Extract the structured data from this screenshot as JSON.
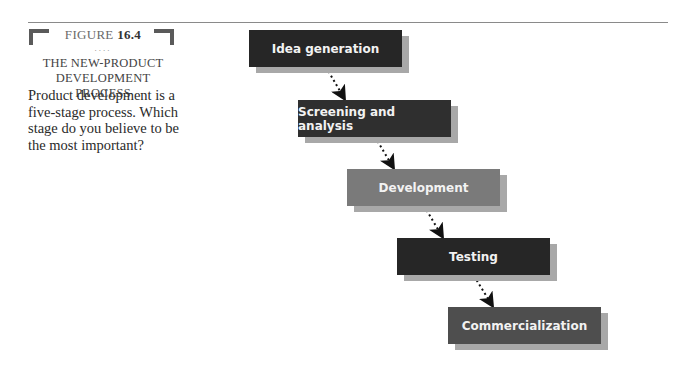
{
  "figure": {
    "label_prefix": "FIGURE",
    "number": "16.4",
    "separator": "....",
    "title_line1": "THE NEW-PRODUCT",
    "title_line2": "DEVELOPMENT PROCESS",
    "caption": "Product development is a five-stage process. Which stage do you believe to be the most important?"
  },
  "stages": [
    {
      "label": "Idea generation",
      "color": "#262626"
    },
    {
      "label": "Screening and analysis",
      "color": "#2f2f2f"
    },
    {
      "label": "Development",
      "color": "#7a7a7a"
    },
    {
      "label": "Testing",
      "color": "#262626"
    },
    {
      "label": "Commercialization",
      "color": "#4e4e4e"
    }
  ],
  "colors": {
    "shadow": "#a8a8a8",
    "arrow": "#111111"
  }
}
